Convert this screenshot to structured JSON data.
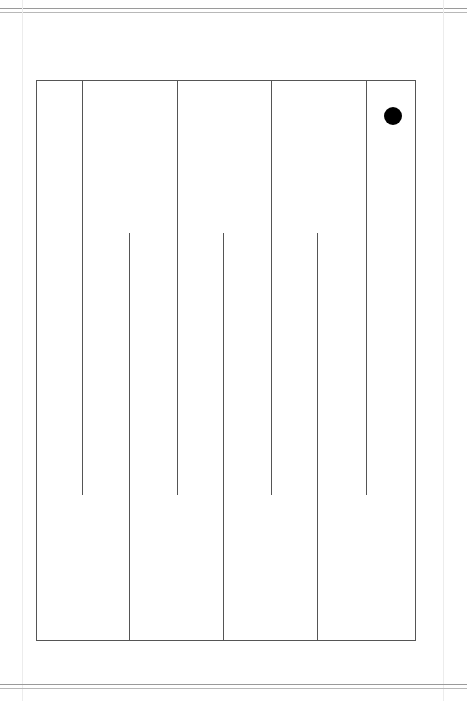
{
  "diagram": {
    "type": "maze",
    "colors": {
      "line": "#555555",
      "dot": "#000000",
      "background": "#ffffff"
    },
    "outer_rect": {
      "x": 36,
      "y": 80,
      "width": 379,
      "height": 560
    },
    "top_walls_x": [
      82,
      177,
      271,
      366
    ],
    "top_walls_end_y": 495,
    "bottom_walls_x": [
      129,
      223,
      317
    ],
    "bottom_walls_start_y": 233,
    "marker": {
      "shape": "circle",
      "cx": 393,
      "cy": 116,
      "r": 9
    }
  }
}
